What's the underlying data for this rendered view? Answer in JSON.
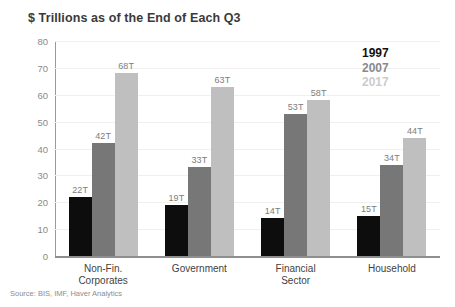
{
  "chart_data": {
    "type": "bar",
    "title": "$ Trillions as of the End of Each Q3",
    "xlabel": "",
    "ylabel": "",
    "ylim": [
      0,
      80
    ],
    "yticks": [
      80,
      70,
      60,
      50,
      40,
      30,
      20,
      10,
      0
    ],
    "grid": true,
    "legend_position": "top-right",
    "categories": [
      "Non-Fin.\nCorporates",
      "Government",
      "Financial\nSector",
      "Household"
    ],
    "series": [
      {
        "name": "1997",
        "color": "#0d0d0d",
        "values": [
          22,
          19,
          14,
          15
        ],
        "labels": [
          "22T",
          "19T",
          "14T",
          "15T"
        ]
      },
      {
        "name": "2007",
        "color": "#777777",
        "values": [
          42,
          33,
          53,
          34
        ],
        "labels": [
          "42T",
          "33T",
          "53T",
          "34T"
        ]
      },
      {
        "name": "2017",
        "color": "#bfbfbf",
        "values": [
          68,
          63,
          58,
          44
        ],
        "labels": [
          "68T",
          "63T",
          "58T",
          "44T"
        ]
      }
    ],
    "source": "Source: BIS, IMF, Haver Analytics"
  }
}
